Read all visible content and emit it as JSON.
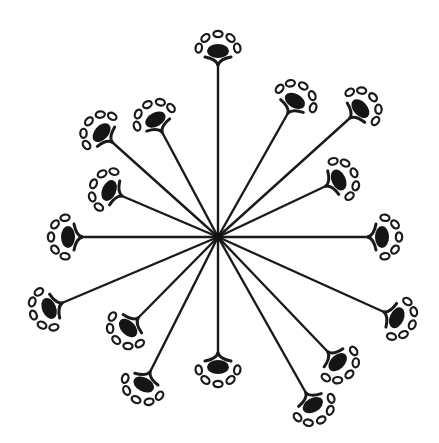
{
  "diagram": {
    "center": {
      "x": 218,
      "y": 237
    },
    "colors": {
      "ink": "#151515",
      "background": "#ffffff"
    },
    "node_count": 16,
    "nodes": [
      {
        "id": "n1",
        "label": "top",
        "x": 218,
        "y": 65,
        "satellites": 5
      },
      {
        "id": "n2",
        "label": "upper-right-inner",
        "x": 288,
        "y": 113,
        "satellites": 5
      },
      {
        "id": "n3",
        "label": "upper-right-outer",
        "x": 350,
        "y": 118,
        "satellites": 5
      },
      {
        "id": "n4",
        "label": "right-upper-inner",
        "x": 326,
        "y": 186,
        "satellites": 5
      },
      {
        "id": "n5",
        "label": "right",
        "x": 368,
        "y": 237,
        "satellites": 5
      },
      {
        "id": "n6",
        "label": "right-lower",
        "x": 384,
        "y": 312,
        "satellites": 5
      },
      {
        "id": "n7",
        "label": "lower-right-inner",
        "x": 328,
        "y": 352,
        "satellites": 5
      },
      {
        "id": "n8",
        "label": "lower-right-outer",
        "x": 306,
        "y": 393,
        "satellites": 5
      },
      {
        "id": "n9",
        "label": "bottom",
        "x": 218,
        "y": 353,
        "satellites": 5
      },
      {
        "id": "n10",
        "label": "lower-left-outer",
        "x": 150,
        "y": 372,
        "satellites": 5
      },
      {
        "id": "n11",
        "label": "lower-left-inner",
        "x": 138,
        "y": 318,
        "satellites": 5
      },
      {
        "id": "n12",
        "label": "left-lower",
        "x": 62,
        "y": 303,
        "satellites": 5
      },
      {
        "id": "n13",
        "label": "left",
        "x": 82,
        "y": 237,
        "satellites": 5
      },
      {
        "id": "n14",
        "label": "left-upper-inner",
        "x": 122,
        "y": 196,
        "satellites": 5
      },
      {
        "id": "n15",
        "label": "upper-left-outer",
        "x": 112,
        "y": 142,
        "satellites": 5
      },
      {
        "id": "n16",
        "label": "upper-left-inner",
        "x": 162,
        "y": 132,
        "satellites": 5
      }
    ]
  }
}
